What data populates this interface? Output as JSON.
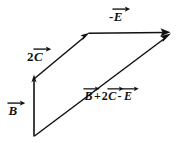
{
  "figure": {
    "kind": "vector-addition-diagram",
    "background_color": "#ffffff",
    "stroke_color": "#111111",
    "text_color": "#111111",
    "width": 181,
    "height": 143
  },
  "labels": {
    "minus_e": {
      "full_text": "-E",
      "sign": "-",
      "symbol": "E",
      "has_vector_arrow": true
    },
    "two_c": {
      "full_text": "2C",
      "coefficient": "2",
      "symbol": "C",
      "has_vector_arrow": true
    },
    "b": {
      "full_text": "B",
      "symbol": "B",
      "has_vector_arrow": true
    },
    "resultant": {
      "full_text": "B + 2C - E",
      "term1_symbol": "B",
      "operator1": "+",
      "coefficient2": "2",
      "term2_symbol": "C",
      "operator2": "-",
      "term3_symbol": "E",
      "has_vector_arrow": true
    }
  },
  "vectors": [
    {
      "name": "B",
      "label": "B",
      "from": [
        34,
        136
      ],
      "to": [
        34,
        75
      ],
      "arrowhead": "end",
      "direction": "up"
    },
    {
      "name": "2C",
      "label": "2C",
      "from": [
        34,
        78
      ],
      "to": [
        89,
        33
      ],
      "arrowhead": "end",
      "direction": "up-right"
    },
    {
      "name": "-E",
      "label": "-E",
      "from": [
        89,
        33
      ],
      "to": [
        170,
        32
      ],
      "arrowhead": "end",
      "direction": "right"
    },
    {
      "name": "resultant",
      "label": "B + 2C - E",
      "from": [
        34,
        136
      ],
      "to": [
        171,
        34
      ],
      "arrowhead": "end",
      "direction": "up-right"
    }
  ]
}
